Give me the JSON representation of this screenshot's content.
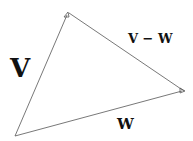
{
  "diagram": {
    "title": "",
    "colors": {
      "stroke": "#555555",
      "text": "#111111",
      "background": "#ffffff"
    },
    "points": {
      "origin": {
        "x": 15,
        "y": 136
      },
      "v_tip": {
        "x": 68,
        "y": 13
      },
      "w_tip": {
        "x": 184,
        "y": 91
      }
    },
    "vectors": [
      {
        "name": "v",
        "from": "origin",
        "to": "v_tip",
        "arrowhead": true
      },
      {
        "name": "w",
        "from": "origin",
        "to": "w_tip",
        "arrowhead": true
      },
      {
        "name": "v - w",
        "from": "w_tip",
        "to": "v_tip",
        "arrowhead": false
      }
    ],
    "labels": {
      "v": "V",
      "w": "W",
      "v_minus_w": "V − W"
    }
  }
}
